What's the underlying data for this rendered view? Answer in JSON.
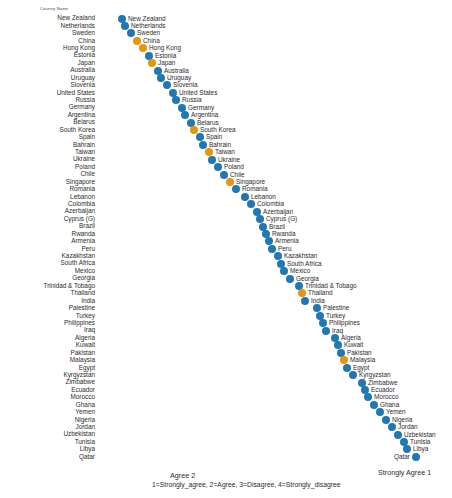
{
  "chart_data": {
    "type": "scatter",
    "title": "",
    "xlabel": "1=Strongly_agree, 2=Agree, 3=Disagree, 4=Strongly_disagree",
    "ylabel": "Country Name",
    "axis_title": "Country Name",
    "xlim": [
      2.05,
      1.0
    ],
    "x_ticks": [
      {
        "label": "Agree  2",
        "value": 2
      },
      {
        "label": "Strongly Agree  1",
        "value": 1
      }
    ],
    "x_note": "1=Strongly_agree, 2=Agree, 3=Disagree, 4=Strongly_disagree",
    "grid": false,
    "legend": "none",
    "colors": {
      "default": "#1f77b4",
      "highlight": "#e8940c"
    },
    "categories": [
      "New Zealand",
      "Netherlands",
      "Sweden",
      "China",
      "Hong Kong",
      "Estonia",
      "Japan",
      "Australia",
      "Uruguay",
      "Slovenia",
      "United States",
      "Russia",
      "Germany",
      "Argentina",
      "Belarus",
      "South Korea",
      "Spain",
      "Bahrain",
      "Taiwan",
      "Ukraine",
      "Poland",
      "Chile",
      "Singapore",
      "Romania",
      "Lebanon",
      "Colombia",
      "Azerbaijan",
      "Cyprus (G)",
      "Brazil",
      "Rwanda",
      "Armenia",
      "Peru",
      "Kazakhstan",
      "South Africa",
      "Mexico",
      "Georgia",
      "Trinidad & Tobago",
      "Thailand",
      "India",
      "Palestine",
      "Turkey",
      "Philippines",
      "Iraq",
      "Algeria",
      "Kuwait",
      "Pakistan",
      "Malaysia",
      "Egypt",
      "Kyrgyzstan",
      "Zimbabwe",
      "Ecuador",
      "Morocco",
      "Ghana",
      "Yemen",
      "Nigeria",
      "Jordan",
      "Uzbekistan",
      "Tunisia",
      "Libya",
      "Qatar"
    ],
    "values": [
      2.0,
      1.99,
      1.97,
      1.95,
      1.93,
      1.91,
      1.9,
      1.88,
      1.87,
      1.85,
      1.83,
      1.82,
      1.8,
      1.79,
      1.77,
      1.76,
      1.74,
      1.73,
      1.71,
      1.7,
      1.68,
      1.66,
      1.64,
      1.62,
      1.59,
      1.57,
      1.55,
      1.54,
      1.53,
      1.52,
      1.51,
      1.5,
      1.48,
      1.47,
      1.46,
      1.44,
      1.41,
      1.4,
      1.39,
      1.35,
      1.34,
      1.33,
      1.32,
      1.29,
      1.28,
      1.27,
      1.26,
      1.25,
      1.23,
      1.2,
      1.19,
      1.18,
      1.16,
      1.14,
      1.12,
      1.1,
      1.08,
      1.06,
      1.05,
      1.02
    ],
    "highlighted": [
      "China",
      "Hong Kong",
      "Japan",
      "South Korea",
      "Taiwan",
      "Singapore",
      "Thailand",
      "Malaysia"
    ]
  }
}
